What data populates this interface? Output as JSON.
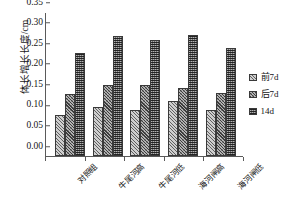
{
  "chart_data": {
    "type": "bar",
    "title": "",
    "xlabel": "",
    "ylabel": "体长增长长度/cm",
    "ylim": [
      0.0,
      0.35
    ],
    "ytick_labels": [
      "0.00",
      "0.05",
      "0.10",
      "0.15",
      "0.20",
      "0.25",
      "0.30",
      "0.35"
    ],
    "ytick_values": [
      0.0,
      0.05,
      0.1,
      0.15,
      0.2,
      0.25,
      0.3,
      0.35
    ],
    "grid": false,
    "legend_position": "right",
    "categories": [
      "对照组",
      "牛尾河高",
      "牛尾河低",
      "海河闸高",
      "海河闸低"
    ],
    "series": [
      {
        "name": "前7d",
        "values": [
          0.1,
          0.12,
          0.111,
          0.133,
          0.111
        ]
      },
      {
        "name": "后7d",
        "values": [
          0.15,
          0.172,
          0.172,
          0.165,
          0.152
        ]
      },
      {
        "name": "14d",
        "values": [
          0.25,
          0.292,
          0.282,
          0.293,
          0.263
        ]
      }
    ]
  },
  "legend": {
    "items": [
      {
        "label": "前7d"
      },
      {
        "label": "后7d"
      },
      {
        "label": "14d"
      }
    ]
  },
  "axis": {
    "y_title": "体长增长长度/cm"
  }
}
